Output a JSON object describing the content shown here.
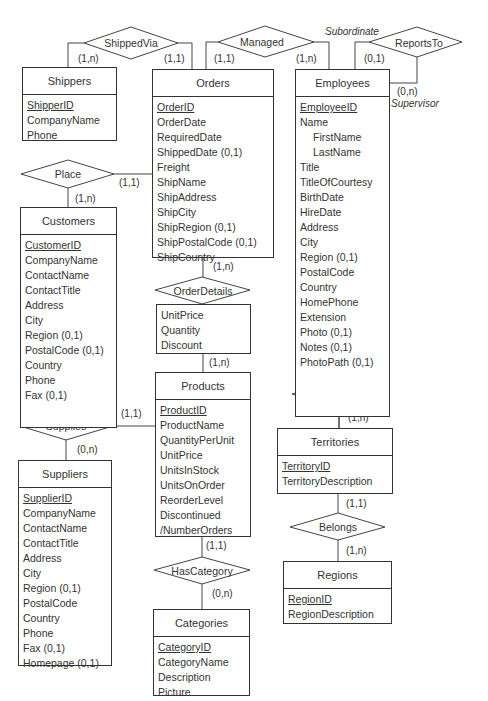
{
  "diagram": {
    "type": "Entity-Relationship diagram",
    "entities": [
      {
        "id": "shippers",
        "name": "Shippers",
        "attributes": [
          {
            "name": "ShipperID",
            "key": true
          },
          {
            "name": "CompanyName"
          },
          {
            "name": "Phone"
          }
        ]
      },
      {
        "id": "orders",
        "name": "Orders",
        "attributes": [
          {
            "name": "OrderID",
            "key": true
          },
          {
            "name": "OrderDate"
          },
          {
            "name": "RequiredDate"
          },
          {
            "name": "ShippedDate (0,1)"
          },
          {
            "name": "Freight"
          },
          {
            "name": "ShipName"
          },
          {
            "name": "ShipAddress"
          },
          {
            "name": "ShipCity"
          },
          {
            "name": "ShipRegion (0,1)"
          },
          {
            "name": "ShipPostalCode (0,1)"
          },
          {
            "name": "ShipCountry"
          }
        ]
      },
      {
        "id": "employees",
        "name": "Employees",
        "attributes": [
          {
            "name": "EmployeeID",
            "key": true
          },
          {
            "name": "Name"
          },
          {
            "name": "FirstName",
            "sub": true
          },
          {
            "name": "LastName",
            "sub": true
          },
          {
            "name": "Title"
          },
          {
            "name": "TitleOfCourtesy"
          },
          {
            "name": "BirthDate"
          },
          {
            "name": "HireDate"
          },
          {
            "name": "Address"
          },
          {
            "name": "City"
          },
          {
            "name": "Region (0,1)"
          },
          {
            "name": "PostalCode"
          },
          {
            "name": "Country"
          },
          {
            "name": "HomePhone"
          },
          {
            "name": "Extension"
          },
          {
            "name": "Photo (0,1)"
          },
          {
            "name": "Notes (0,1)"
          },
          {
            "name": "PhotoPath (0,1)"
          }
        ]
      },
      {
        "id": "customers",
        "name": "Customers",
        "attributes": [
          {
            "name": "CustomerID",
            "key": true
          },
          {
            "name": "CompanyName"
          },
          {
            "name": "ContactName"
          },
          {
            "name": "ContactTitle"
          },
          {
            "name": "Address"
          },
          {
            "name": "City"
          },
          {
            "name": "Region (0,1)"
          },
          {
            "name": "PostalCode (0,1)"
          },
          {
            "name": "Country"
          },
          {
            "name": "Phone"
          },
          {
            "name": "Fax (0,1)"
          }
        ]
      },
      {
        "id": "products",
        "name": "Products",
        "attributes": [
          {
            "name": "ProductID",
            "key": true
          },
          {
            "name": "ProductName"
          },
          {
            "name": "QuantityPerUnit"
          },
          {
            "name": "UnitPrice"
          },
          {
            "name": "UnitsInStock"
          },
          {
            "name": "UnitsOnOrder"
          },
          {
            "name": "ReorderLevel"
          },
          {
            "name": "Discontinued"
          },
          {
            "name": "/NumberOrders"
          }
        ]
      },
      {
        "id": "suppliers",
        "name": "Suppliers",
        "attributes": [
          {
            "name": "SupplierID",
            "key": true
          },
          {
            "name": "CompanyName"
          },
          {
            "name": "ContactName"
          },
          {
            "name": "ContactTitle"
          },
          {
            "name": "Address"
          },
          {
            "name": "City"
          },
          {
            "name": "Region (0,1)"
          },
          {
            "name": "PostalCode"
          },
          {
            "name": "Country"
          },
          {
            "name": "Phone"
          },
          {
            "name": "Fax (0,1)"
          },
          {
            "name": "Homepage (0,1)"
          }
        ]
      },
      {
        "id": "categories",
        "name": "Categories",
        "attributes": [
          {
            "name": "CategoryID",
            "key": true
          },
          {
            "name": "CategoryName"
          },
          {
            "name": "Description"
          },
          {
            "name": "Picture"
          }
        ]
      },
      {
        "id": "territories",
        "name": "Territories",
        "attributes": [
          {
            "name": "TerritoryID",
            "key": true
          },
          {
            "name": "TerritoryDescription"
          }
        ]
      },
      {
        "id": "regions",
        "name": "Regions",
        "attributes": [
          {
            "name": "RegionID",
            "key": true
          },
          {
            "name": "RegionDescription"
          }
        ]
      }
    ],
    "relationships": [
      {
        "id": "shippedvia",
        "name": "ShippedVia"
      },
      {
        "id": "managed",
        "name": "Managed"
      },
      {
        "id": "reportsto",
        "name": "ReportsTo"
      },
      {
        "id": "place",
        "name": "Place"
      },
      {
        "id": "orderdetails",
        "name": "OrderDetails",
        "attributes": [
          "UnitPrice",
          "Quantity",
          "Discount"
        ]
      },
      {
        "id": "supplies",
        "name": "Supplies"
      },
      {
        "id": "employeeterritories",
        "name_line1": "Employee",
        "name_line2": "Territories"
      },
      {
        "id": "hascategory",
        "name": "HasCategory"
      },
      {
        "id": "belongs",
        "name": "Belongs"
      }
    ],
    "cardinalities": {
      "shippedvia_shippers": "(1,n)",
      "shippedvia_orders": "(1,1)",
      "managed_orders": "(1,1)",
      "managed_employees": "(1,n)",
      "reportsto_subordinate": "(0,1)",
      "reportsto_supervisor": "(0,n)",
      "place_orders": "(1,1)",
      "place_customers": "(1,n)",
      "orderdetails_orders": "(1,n)",
      "orderdetails_products": "(1,n)",
      "supplies_products": "(1,1)",
      "supplies_suppliers": "(0,n)",
      "empterr_employees": "(1,n)",
      "empterr_territories": "(1,n)",
      "hascategory_products": "(1,1)",
      "hascategory_categories": "(0,n)",
      "belongs_territories": "(1,1)",
      "belongs_regions": "(1,n)"
    },
    "roles": {
      "subordinate": "Subordinate",
      "supervisor": "Supervisor"
    }
  }
}
